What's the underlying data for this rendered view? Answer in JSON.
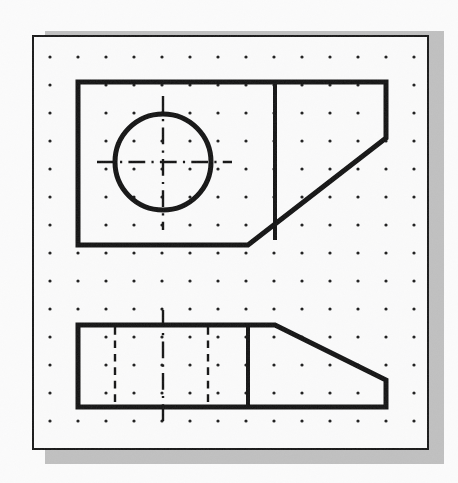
{
  "document": {
    "title": "Orthographic Projection Exercise",
    "sheet_label": "Isometric Dot Grid Sheet",
    "frame": {
      "x": 32,
      "y": 35,
      "width": 397,
      "height": 415,
      "border_color": "#151515",
      "border_width": 2
    },
    "shadow": {
      "x": 45,
      "y": 31,
      "width": 399,
      "height": 433,
      "color": "#b3b3b3"
    },
    "background_color": "#fbfbfb",
    "paper_color": "#fafafa",
    "ink_color": "#101010"
  },
  "grid": {
    "type": "dot-grid",
    "origin_x": 50,
    "origin_y": 57,
    "spacing_x": 28,
    "spacing_y": 28,
    "cols": 14,
    "rows": 15,
    "dot_radius": 1.6,
    "dot_color": "#1a1a1a"
  },
  "views": [
    {
      "name": "top-view",
      "label": "Top View",
      "line_weight": 5,
      "outline": [
        [
          78,
          82
        ],
        [
          386,
          82
        ],
        [
          386,
          138
        ],
        [
          248,
          245
        ],
        [
          78,
          245
        ]
      ],
      "internal_lines": [
        {
          "name": "vertical-edge-line",
          "x1": 275,
          "y1": 82,
          "x2": 275,
          "y2": 238,
          "weight": 4,
          "style": "solid"
        }
      ],
      "circle": {
        "name": "through-hole",
        "cx": 163,
        "cy": 162,
        "r": 48,
        "weight": 5,
        "style": "solid"
      },
      "center_lines": [
        {
          "name": "horizontal-center-line",
          "x1": 97,
          "y1": 162,
          "x2": 232,
          "y2": 162,
          "style": "dash-dot",
          "weight": 2.4
        },
        {
          "name": "vertical-center-line",
          "x1": 163,
          "y1": 96,
          "x2": 163,
          "y2": 230,
          "style": "dash-dot",
          "weight": 2.4
        }
      ]
    },
    {
      "name": "front-view",
      "label": "Front View",
      "line_weight": 5,
      "outline": [
        [
          78,
          325
        ],
        [
          275,
          325
        ],
        [
          386,
          380
        ],
        [
          386,
          407
        ],
        [
          78,
          407
        ]
      ],
      "internal_lines": [
        {
          "name": "vertical-edge-line",
          "x1": 248,
          "y1": 325,
          "x2": 248,
          "y2": 407,
          "weight": 4,
          "style": "solid"
        }
      ],
      "hidden_lines": [
        {
          "name": "hidden-hole-edge-left",
          "x1": 115,
          "y1": 327,
          "x2": 115,
          "y2": 405,
          "style": "dashed",
          "weight": 2.4
        },
        {
          "name": "hidden-hole-edge-right",
          "x1": 208,
          "y1": 327,
          "x2": 208,
          "y2": 405,
          "style": "dashed",
          "weight": 2.4
        }
      ],
      "center_lines": [
        {
          "name": "vertical-center-line",
          "x1": 163,
          "y1": 310,
          "x2": 163,
          "y2": 422,
          "style": "dash-dot",
          "weight": 2.4
        }
      ]
    }
  ]
}
